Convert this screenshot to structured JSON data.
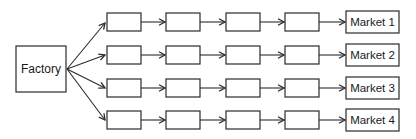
{
  "diagram": {
    "factory": {
      "label": "Factory"
    },
    "stages_per_row": 4,
    "rows": [
      {
        "market": {
          "label": "Market 1"
        }
      },
      {
        "market": {
          "label": "Market 2"
        }
      },
      {
        "market": {
          "label": "Market 3"
        }
      },
      {
        "market": {
          "label": "Market 4"
        }
      }
    ],
    "colors": {
      "line": "#2b2b2b",
      "box_fill": "#ffffff",
      "text": "#1a1a1a",
      "background": "#ffffff"
    }
  }
}
